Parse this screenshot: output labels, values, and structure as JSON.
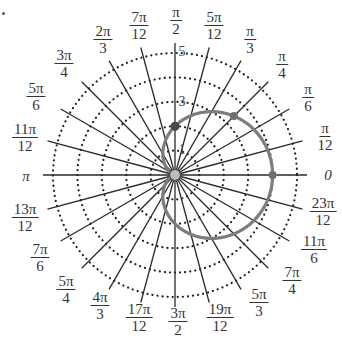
{
  "chart_data": {
    "type": "polar",
    "title": "",
    "curve": {
      "equation": "r = 2 + 2cos(theta)",
      "color": "#7a7a7a",
      "kind": "cardioid"
    },
    "marked_points": [
      {
        "theta": "0",
        "r": 4
      },
      {
        "theta": "pi/4",
        "r": 3.41
      },
      {
        "theta": "pi/2",
        "r": 2
      }
    ],
    "grid": {
      "circles": [
        1,
        2,
        3,
        4,
        5
      ],
      "circle_style": "dotted",
      "rays_step": "pi/12"
    },
    "radial_tick_labels": [
      "1",
      "3",
      "5"
    ],
    "rlim": [
      0,
      5
    ],
    "angle_labels": [
      {
        "num": "",
        "den": "",
        "text": "0",
        "deg": 0
      },
      {
        "num": "π",
        "den": "12",
        "deg": 15
      },
      {
        "num": "π",
        "den": "6",
        "deg": 30
      },
      {
        "num": "π",
        "den": "4",
        "deg": 45
      },
      {
        "num": "π",
        "den": "3",
        "deg": 60
      },
      {
        "num": "5π",
        "den": "12",
        "deg": 75
      },
      {
        "num": "π",
        "den": "2",
        "deg": 90
      },
      {
        "num": "7π",
        "den": "12",
        "deg": 105
      },
      {
        "num": "2π",
        "den": "3",
        "deg": 120
      },
      {
        "num": "3π",
        "den": "4",
        "deg": 135
      },
      {
        "num": "5π",
        "den": "6",
        "deg": 150
      },
      {
        "num": "11π",
        "den": "12",
        "deg": 165
      },
      {
        "num": "",
        "den": "",
        "text": "π",
        "deg": 180
      },
      {
        "num": "13π",
        "den": "12",
        "deg": 195
      },
      {
        "num": "7π",
        "den": "6",
        "deg": 210
      },
      {
        "num": "5π",
        "den": "4",
        "deg": 225
      },
      {
        "num": "4π",
        "den": "3",
        "deg": 240
      },
      {
        "num": "17π",
        "den": "12",
        "deg": 255
      },
      {
        "num": "3π",
        "den": "2",
        "deg": 270
      },
      {
        "num": "19π",
        "den": "12",
        "deg": 285
      },
      {
        "num": "5π",
        "den": "3",
        "deg": 300
      },
      {
        "num": "7π",
        "den": "4",
        "deg": 315
      },
      {
        "num": "11π",
        "den": "6",
        "deg": 330
      },
      {
        "num": "23π",
        "den": "12",
        "deg": 345
      }
    ]
  },
  "labels": {
    "a0": "0",
    "api": "π",
    "a15": {
      "n": "π",
      "d": "12"
    },
    "a30": {
      "n": "π",
      "d": "6"
    },
    "a45": {
      "n": "π",
      "d": "4"
    },
    "a60": {
      "n": "π",
      "d": "3"
    },
    "a75": {
      "n": "5π",
      "d": "12"
    },
    "a90": {
      "n": "π",
      "d": "2"
    },
    "a105": {
      "n": "7π",
      "d": "12"
    },
    "a120": {
      "n": "2π",
      "d": "3"
    },
    "a135": {
      "n": "3π",
      "d": "4"
    },
    "a150": {
      "n": "5π",
      "d": "6"
    },
    "a165": {
      "n": "11π",
      "d": "12"
    },
    "a195": {
      "n": "13π",
      "d": "12"
    },
    "a210": {
      "n": "7π",
      "d": "6"
    },
    "a225": {
      "n": "5π",
      "d": "4"
    },
    "a240": {
      "n": "4π",
      "d": "3"
    },
    "a255": {
      "n": "17π",
      "d": "12"
    },
    "a270": {
      "n": "3π",
      "d": "2"
    },
    "a285": {
      "n": "19π",
      "d": "12"
    },
    "a300": {
      "n": "5π",
      "d": "3"
    },
    "a315": {
      "n": "7π",
      "d": "4"
    },
    "a330": {
      "n": "11π",
      "d": "6"
    },
    "a345": {
      "n": "23π",
      "d": "12"
    },
    "r1": "1",
    "r3": "3",
    "r5": "5"
  }
}
